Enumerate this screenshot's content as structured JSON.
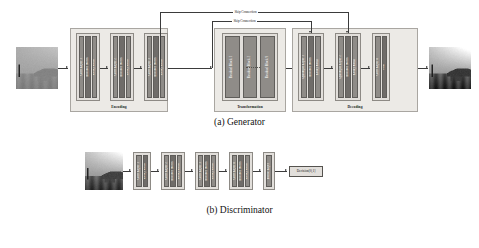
{
  "figure": {
    "captions": {
      "generator": "(a) Generator",
      "discriminator": "(b) Discriminator"
    },
    "skip_connections": [
      {
        "label": "Skip Connection"
      },
      {
        "label": "Skip Connection"
      }
    ]
  },
  "generator": {
    "input_image": {
      "name": "hazy-input-image",
      "alt": "hazy landscape photograph"
    },
    "output_image": {
      "name": "dehazed-output-image",
      "alt": "dehazed landscape photograph"
    },
    "sections": [
      {
        "id": "encoding",
        "label": "Encoding",
        "blocks": [
          {
            "id": "conv1",
            "layers": [
              "Conv Layer 1",
              "Instance Norm",
              "Leaky ReLu"
            ]
          },
          {
            "id": "conv2",
            "layers": [
              "Conv Layer 2",
              "Instance Norm",
              "Leaky ReLu"
            ]
          },
          {
            "id": "conv3",
            "layers": [
              "Conv Layer 3",
              "Instance Norm",
              "Leaky ReLu"
            ]
          }
        ]
      },
      {
        "id": "transformation",
        "label": "Transformation",
        "blocks": [
          {
            "id": "resblock1",
            "layers": [
              "Residual Block 1",
              "Residual Block 2",
              "Residual Block 9"
            ]
          }
        ]
      },
      {
        "id": "decoding",
        "label": "Decoding",
        "blocks": [
          {
            "id": "up1",
            "layers": [
              "Upsample Layer 1",
              "Instance Norm",
              "Leaky ReLu"
            ]
          },
          {
            "id": "up2",
            "layers": [
              "Upsample Layer 2",
              "Instance Norm",
              "Leaky ReLu"
            ]
          },
          {
            "id": "convout",
            "layers": [
              "Conv Layer 4",
              "Tanh"
            ]
          }
        ]
      }
    ]
  },
  "discriminator": {
    "input_image": {
      "name": "discriminator-input-image",
      "alt": "landscape photograph"
    },
    "blocks": [
      {
        "id": "d1",
        "layers": [
          "Conv Layer 1",
          "Leaky ReLu"
        ]
      },
      {
        "id": "d2",
        "layers": [
          "Conv Layer 2",
          "Instance Norm",
          "Leaky ReLu"
        ]
      },
      {
        "id": "d3",
        "layers": [
          "Conv Layer 3",
          "Instance Norm",
          "Leaky ReLu"
        ]
      },
      {
        "id": "d4",
        "layers": [
          "Conv Layer 4",
          "Instance Norm",
          "Leaky ReLu"
        ]
      },
      {
        "id": "d5",
        "layers": [
          "Dense Layer"
        ]
      }
    ],
    "output": {
      "label": "Decision[0,1]"
    }
  },
  "colors": {
    "group_fill": "#eceae6",
    "block_fill": "#e2dfdb",
    "bar_fill": "#8f8c88",
    "bar_fill_dark": "#6f6c69",
    "stroke": "#3b3b3b",
    "text": "#111111"
  }
}
